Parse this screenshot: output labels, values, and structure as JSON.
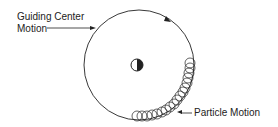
{
  "diagram": {
    "labels": {
      "guiding_center_line1": "Guiding Center",
      "guiding_center_line2": "Motion",
      "particle_motion": "Particle Motion"
    },
    "icons": {
      "center": "half-filled-circle-icon",
      "direction": "arrowhead-icon"
    },
    "colors": {
      "stroke": "#222222",
      "background": "#ffffff"
    }
  }
}
